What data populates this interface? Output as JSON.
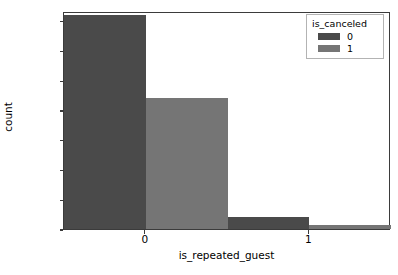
{
  "chart_data": {
    "type": "bar",
    "title": "",
    "xlabel": "is_repeated_guest",
    "ylabel": "count",
    "categories": [
      "0",
      "1"
    ],
    "series": [
      {
        "name": "0",
        "color": "#4a4a4a",
        "values": [
          72000,
          4000
        ]
      },
      {
        "name": "1",
        "color": "#757575",
        "values": [
          44200,
          1200
        ]
      }
    ],
    "legend": {
      "title": "is_canceled",
      "position": "upper right",
      "entries": [
        {
          "label": "0",
          "color": "#4a4a4a"
        },
        {
          "label": "1",
          "color": "#757575"
        }
      ]
    },
    "xtick_labels": [
      "0",
      "1"
    ],
    "ytick_labels": [
      "0",
      "10000",
      "20000",
      "30000",
      "40000",
      "50000",
      "60000",
      "70000"
    ],
    "ytick_values": [
      0,
      10000,
      20000,
      30000,
      40000,
      50000,
      60000,
      70000
    ],
    "ylim": [
      0,
      73300
    ],
    "xlim": [
      -0.5,
      1.5
    ],
    "grid": false
  },
  "axes": {
    "spine_color": "#3b3b3b"
  }
}
